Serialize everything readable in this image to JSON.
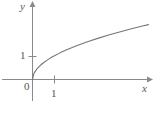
{
  "figure": {
    "axis_labels": {
      "x": "x",
      "y": "y"
    },
    "tick_labels": {
      "origin": "0",
      "x_one": "1",
      "y_one": "1"
    },
    "colors": {
      "axis": "#8a8a8a",
      "curve": "#767676",
      "text": "#555555",
      "background": "#ffffff"
    }
  },
  "chart_data": {
    "type": "line",
    "title": "",
    "xlabel": "x",
    "ylabel": "y",
    "grid": false,
    "legend": null,
    "xlim": [
      -1.45,
      5.6
    ],
    "ylim": [
      -0.85,
      3.2
    ],
    "xticks": [
      1
    ],
    "xticklabels": [
      "1"
    ],
    "yticks": [
      1
    ],
    "yticklabels": [
      "1"
    ],
    "origin_label": "0",
    "series": [
      {
        "name": "y = sqrt(x)",
        "x": [
          0,
          0.05,
          0.1,
          0.2,
          0.3,
          0.4,
          0.5,
          0.7,
          0.85,
          1.0,
          1.25,
          1.5,
          1.75,
          2.0,
          2.5,
          3.0,
          3.5,
          4.0,
          4.5,
          5.0,
          5.27
        ],
        "y": [
          0,
          0.224,
          0.316,
          0.447,
          0.548,
          0.632,
          0.707,
          0.837,
          0.922,
          1.0,
          1.118,
          1.225,
          1.323,
          1.414,
          1.581,
          1.732,
          1.871,
          2.0,
          2.121,
          2.236,
          2.296
        ]
      }
    ]
  }
}
